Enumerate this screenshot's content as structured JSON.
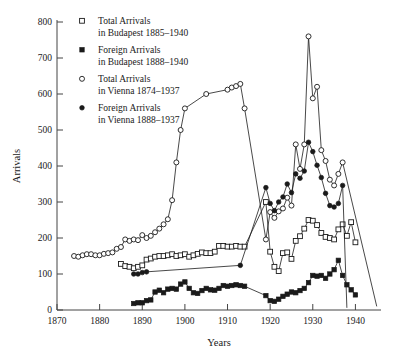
{
  "chart_data": {
    "type": "line",
    "title": "",
    "xlabel": "Years",
    "ylabel": "Arrivals",
    "xlim": [
      1870,
      1946
    ],
    "ylim": [
      0,
      800
    ],
    "xticks": [
      1870,
      1880,
      1890,
      1900,
      1910,
      1920,
      1930,
      1940
    ],
    "yticks": [
      0,
      100,
      200,
      300,
      400,
      500,
      600,
      700,
      800
    ],
    "grid": false,
    "legend_position": "top-left-inside",
    "series": [
      {
        "name": "Total Arrivals in Budapest 1885–1940",
        "legend_line1": "Total Arrivals",
        "legend_line2": "in Budapest 1885–1940",
        "marker": "open-square",
        "x": [
          1885,
          1886,
          1887,
          1888,
          1889,
          1890,
          1891,
          1892,
          1893,
          1894,
          1895,
          1896,
          1897,
          1898,
          1899,
          1900,
          1901,
          1902,
          1903,
          1904,
          1905,
          1906,
          1907,
          1908,
          1909,
          1910,
          1911,
          1912,
          1913,
          1914,
          1919,
          1920,
          1921,
          1922,
          1923,
          1924,
          1925,
          1926,
          1927,
          1928,
          1929,
          1930,
          1931,
          1932,
          1933,
          1934,
          1935,
          1936,
          1937,
          1938,
          1939,
          1940
        ],
        "y": [
          128,
          122,
          120,
          116,
          120,
          124,
          140,
          143,
          148,
          150,
          150,
          152,
          155,
          150,
          152,
          155,
          148,
          152,
          156,
          160,
          158,
          158,
          162,
          178,
          178,
          176,
          176,
          178,
          176,
          176,
          300,
          162,
          120,
          108,
          158,
          160,
          142,
          192,
          205,
          226,
          250,
          248,
          236,
          214,
          203,
          200,
          196,
          224,
          238,
          206,
          244,
          188
        ]
      },
      {
        "name": "Foreign Arrivals in Budapest 1888–1940",
        "legend_line1": "Foreign Arrivals",
        "legend_line2": "in Budapest 1888–1940",
        "marker": "filled-square",
        "x": [
          1888,
          1889,
          1890,
          1891,
          1892,
          1893,
          1894,
          1895,
          1896,
          1897,
          1898,
          1899,
          1900,
          1901,
          1902,
          1903,
          1904,
          1905,
          1906,
          1907,
          1908,
          1909,
          1910,
          1911,
          1912,
          1913,
          1914,
          1919,
          1920,
          1921,
          1922,
          1923,
          1924,
          1925,
          1926,
          1927,
          1928,
          1929,
          1930,
          1931,
          1932,
          1933,
          1934,
          1935,
          1936,
          1937,
          1938,
          1939,
          1940
        ],
        "y": [
          18,
          20,
          20,
          26,
          28,
          50,
          55,
          48,
          58,
          60,
          58,
          72,
          78,
          60,
          48,
          46,
          54,
          60,
          56,
          55,
          60,
          68,
          66,
          68,
          70,
          68,
          66,
          40,
          26,
          24,
          30,
          38,
          44,
          50,
          48,
          54,
          60,
          76,
          96,
          94,
          96,
          88,
          100,
          112,
          138,
          96,
          70,
          56,
          42
        ]
      },
      {
        "name": "Total Arrivals in Vienna 1874–1937",
        "legend_line1": "Total Arrivals",
        "legend_line2": "in Vienna 1874–1937",
        "marker": "open-circle",
        "x": [
          1874,
          1875,
          1876,
          1877,
          1878,
          1879,
          1880,
          1881,
          1882,
          1883,
          1884,
          1885,
          1886,
          1887,
          1888,
          1889,
          1890,
          1891,
          1892,
          1893,
          1894,
          1895,
          1896,
          1897,
          1898,
          1899,
          1900,
          1905,
          1910,
          1911,
          1912,
          1913,
          1914,
          1919,
          1920,
          1921,
          1922,
          1923,
          1924,
          1925,
          1926,
          1927,
          1928,
          1929,
          1930,
          1931,
          1932,
          1933,
          1934,
          1935,
          1936,
          1937,
          1945
        ],
        "y": [
          150,
          148,
          152,
          155,
          155,
          152,
          152,
          156,
          158,
          160,
          170,
          175,
          196,
          192,
          196,
          194,
          208,
          200,
          206,
          216,
          226,
          238,
          252,
          305,
          410,
          500,
          560,
          600,
          612,
          618,
          622,
          628,
          560,
          196,
          272,
          256,
          274,
          282,
          312,
          290,
          460,
          392,
          460,
          760,
          588,
          620,
          444,
          414,
          362,
          346,
          378,
          410,
          10
        ]
      },
      {
        "name": "Foreign Arrivals in Vienna 1888–1937",
        "legend_line1": "Foreign Arrivals",
        "legend_line2": "in Vienna 1888–1937",
        "marker": "filled-circle",
        "x": [
          1888,
          1889,
          1890,
          1891,
          1913,
          1919,
          1920,
          1921,
          1922,
          1923,
          1924,
          1925,
          1926,
          1927,
          1928,
          1929,
          1930,
          1931,
          1932,
          1933,
          1934,
          1935,
          1936,
          1937,
          1938
        ],
        "y": [
          100,
          100,
          104,
          106,
          124,
          340,
          296,
          276,
          300,
          314,
          350,
          326,
          378,
          366,
          386,
          466,
          440,
          402,
          368,
          324,
          290,
          286,
          296,
          346,
          6
        ]
      }
    ]
  }
}
